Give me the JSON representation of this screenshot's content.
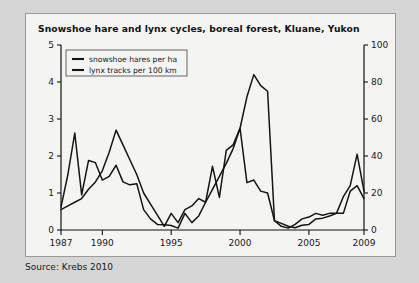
{
  "figure": {
    "title": "Snowshoe hare and lynx cycles, boreal forest, Kluane, Yukon",
    "source": "Source: Krebs 2010"
  },
  "chart_data": {
    "type": "line",
    "title": "Snowshoe hare and lynx cycles, boreal forest, Kluane, Yukon",
    "xlabel": "",
    "ylabel": "",
    "y_left_label": "snowshoe hares per ha",
    "y_right_label": "lynx tracks per 100 km",
    "xlim": [
      1987,
      2009
    ],
    "ylim_left": [
      0,
      5
    ],
    "ylim_right": [
      0,
      100
    ],
    "xticks": [
      1987,
      1990,
      1995,
      2000,
      2005,
      2009
    ],
    "xtick_labels": [
      "1987",
      "1990",
      "1995",
      "2000",
      "2005",
      "2009"
    ],
    "yticks_left": [
      0,
      1,
      2,
      3,
      4,
      5
    ],
    "ytick_labels_left": [
      "0",
      "1",
      "2",
      "3",
      "4",
      "5"
    ],
    "yticks_right": [
      0,
      20,
      40,
      60,
      80,
      100
    ],
    "ytick_labels_right": [
      "0",
      "20",
      "40",
      "60",
      "80",
      "100"
    ],
    "grid": false,
    "legend_position": "upper left",
    "x": [
      1987,
      1987.5,
      1988,
      1988.5,
      1989,
      1989.5,
      1990,
      1990.5,
      1991,
      1991.5,
      1992,
      1992.5,
      1993,
      1993.5,
      1994,
      1994.5,
      1995,
      1995.5,
      1996,
      1996.5,
      1997,
      1997.5,
      1998,
      1998.5,
      1999,
      1999.5,
      2000,
      2000.5,
      2001,
      2001.5,
      2002,
      2002.5,
      2003,
      2003.5,
      2004,
      2004.5,
      2005,
      2005.5,
      2006,
      2006.5,
      2007,
      2007.5,
      2008,
      2008.5,
      2009
    ],
    "series": [
      {
        "name": "snowshoe hares per ha",
        "axis": "left",
        "units": "hares per ha",
        "values": [
          0.62,
          1.5,
          2.62,
          0.95,
          1.88,
          1.82,
          1.35,
          1.45,
          1.75,
          1.3,
          1.22,
          1.25,
          0.55,
          0.3,
          0.15,
          0.14,
          0.12,
          0.05,
          0.45,
          0.2,
          0.38,
          0.75,
          1.72,
          0.88,
          2.15,
          2.3,
          2.75,
          1.28,
          1.35,
          1.05,
          1.0,
          0.25,
          0.18,
          0.1,
          0.06,
          0.13,
          0.15,
          0.3,
          0.32,
          0.38,
          0.45,
          0.45,
          1.05,
          1.2,
          0.85
        ]
      },
      {
        "name": "lynx tracks per 100 km",
        "axis": "right",
        "units": "tracks per 100 km",
        "values": [
          11,
          13,
          15,
          17,
          22,
          26,
          32,
          42,
          54,
          46,
          38,
          30,
          20,
          14,
          8,
          2,
          9,
          4,
          11,
          13,
          17,
          15,
          22,
          29,
          36,
          44,
          55,
          72,
          84,
          78,
          75,
          5,
          2,
          1,
          3,
          6,
          7,
          9,
          8,
          9,
          9,
          18,
          24,
          41,
          21
        ]
      }
    ],
    "series_hare_points": {
      "name": "snowshoe hares per ha",
      "year_value_pairs": [
        [
          1987,
          0.62
        ],
        [
          1988,
          2.62
        ],
        [
          1988.4,
          0.95
        ],
        [
          1989,
          1.88
        ],
        [
          1990,
          1.75
        ],
        [
          1991,
          1.3
        ],
        [
          1992,
          1.25
        ],
        [
          1993,
          0.45
        ],
        [
          1994,
          0.15
        ],
        [
          1995,
          0.45
        ],
        [
          1996,
          0.8
        ],
        [
          1997,
          0.88
        ],
        [
          1998,
          2.75
        ],
        [
          1999,
          1.3
        ],
        [
          2000,
          1.35
        ],
        [
          2001,
          0.2
        ],
        [
          2002,
          0.12
        ],
        [
          2003,
          0.18
        ],
        [
          2004,
          0.42
        ],
        [
          2005,
          0.45
        ],
        [
          2006,
          1.2
        ],
        [
          2007,
          0.85
        ],
        [
          2008,
          0.35
        ],
        [
          2009,
          0.68
        ]
      ]
    },
    "series_lynx_points": {
      "name": "lynx tracks per 100 km",
      "year_value_pairs": [
        [
          1987,
          11
        ],
        [
          1989,
          22
        ],
        [
          1990,
          34
        ],
        [
          1991,
          54
        ],
        [
          1993,
          24
        ],
        [
          1994,
          2
        ],
        [
          1995,
          9
        ],
        [
          1997,
          17
        ],
        [
          1998,
          40
        ],
        [
          1999,
          84
        ],
        [
          2000,
          74
        ],
        [
          2001,
          4
        ],
        [
          2002,
          1
        ],
        [
          2003,
          6
        ],
        [
          2005,
          9
        ],
        [
          2006,
          20
        ],
        [
          2007,
          41
        ],
        [
          2008,
          18
        ],
        [
          2009,
          21
        ]
      ]
    },
    "legend": [
      {
        "label": "snowshoe hares per ha",
        "color": "#141414"
      },
      {
        "label": "lynx tracks per 100 km",
        "color": "#141414"
      }
    ],
    "colors": {
      "line": "#141414",
      "axis": "#111111",
      "plot_background": "#f4f4f2",
      "page_background": "#d6d6d6",
      "card_border": "#9a9a9a"
    }
  }
}
